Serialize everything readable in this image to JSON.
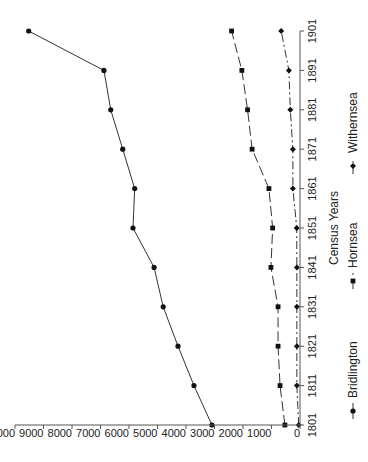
{
  "chart_data": {
    "type": "line",
    "orientation": "rotated-90-clockwise",
    "title": "",
    "xlabel": "Census Years",
    "ylabel": "",
    "categories": [
      "1801",
      "1811",
      "1821",
      "1831",
      "1841",
      "1851",
      "1861",
      "1871",
      "1881",
      "1891",
      "1901"
    ],
    "ylim": [
      0,
      10000
    ],
    "yticks": [
      0,
      1000,
      2000,
      3000,
      4000,
      5000,
      6000,
      7000,
      8000,
      9000,
      10000
    ],
    "grid": false,
    "legend_position": "bottom",
    "series": [
      {
        "name": "Bridlington",
        "marker": "circle",
        "line": "solid",
        "values": [
          3090,
          3720,
          4280,
          4800,
          5120,
          5860,
          5800,
          6220,
          6640,
          6880,
          9520
        ]
      },
      {
        "name": "Hornsea",
        "marker": "square",
        "line": "dash",
        "values": [
          530,
          700,
          770,
          770,
          1020,
          960,
          1090,
          1680,
          1840,
          2040,
          2400
        ]
      },
      {
        "name": "Withernsea",
        "marker": "diamond",
        "line": "dashdot",
        "values": [
          45,
          110,
          110,
          110,
          110,
          115,
          250,
          250,
          340,
          390,
          660
        ]
      }
    ]
  },
  "labels": {
    "xlabel": "Census Years",
    "legend": [
      "Bridlington",
      "Hornsea",
      "Withernsea"
    ]
  }
}
